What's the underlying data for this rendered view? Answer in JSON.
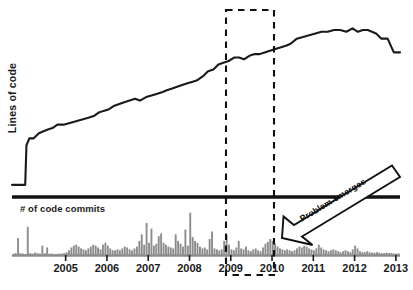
{
  "chart_data": {
    "type": "line",
    "title": "",
    "xlabel": "",
    "ylabel": "Lines of code",
    "grid": false,
    "legend": "none",
    "x_tick_labels": [
      "2005",
      "2006",
      "2007",
      "2008",
      "2009",
      "2010",
      "2011",
      "2012",
      "2013"
    ],
    "x_range": [
      "2004.2",
      "2013.6"
    ],
    "panels": [
      {
        "name": "lines-of-code",
        "type": "line",
        "ylabel": "Lines of code",
        "ylim": [
          0,
          100
        ],
        "series_name": "Lines of code",
        "line_color": "#1a1a1a",
        "x": [
          2004.2,
          2004.35,
          2004.45,
          2004.52,
          2004.55,
          2004.62,
          2004.72,
          2004.85,
          2004.95,
          2005.05,
          2005.18,
          2005.3,
          2005.45,
          2005.6,
          2005.75,
          2005.9,
          2006.05,
          2006.18,
          2006.3,
          2006.42,
          2006.55,
          2006.68,
          2006.8,
          2006.92,
          2007.05,
          2007.18,
          2007.3,
          2007.45,
          2007.58,
          2007.72,
          2007.85,
          2007.95,
          2008.08,
          2008.2,
          2008.32,
          2008.45,
          2008.58,
          2008.7,
          2008.82,
          2008.95,
          2009.08,
          2009.2,
          2009.32,
          2009.45,
          2009.58,
          2009.7,
          2009.82,
          2009.95,
          2010.08,
          2010.2,
          2010.32,
          2010.45,
          2010.58,
          2010.72,
          2010.85,
          2010.95,
          2011.1,
          2011.25,
          2011.4,
          2011.55,
          2011.7,
          2011.85,
          2012.0,
          2012.15,
          2012.3,
          2012.45,
          2012.58,
          2012.7,
          2012.82,
          2012.92,
          2013.02,
          2013.15,
          2013.3,
          2013.45,
          2013.6
        ],
        "y": [
          3,
          3,
          3,
          3,
          26,
          30,
          30,
          33,
          34,
          35,
          36,
          38,
          38,
          39,
          40,
          41,
          42,
          43,
          45,
          46,
          47,
          49,
          50,
          51,
          52,
          53,
          52,
          54,
          55,
          56,
          57,
          58,
          59,
          60,
          61,
          62,
          63,
          64,
          66,
          69,
          70,
          73,
          74,
          75,
          77,
          77,
          76,
          78,
          79,
          79,
          80,
          81,
          82,
          83,
          84,
          85,
          88,
          89,
          90,
          91,
          92,
          92,
          93,
          93,
          92,
          94,
          92,
          93,
          93,
          92,
          91,
          88,
          88,
          80,
          80
        ]
      },
      {
        "name": "code-commits",
        "type": "bar",
        "ylabel": "# of code commits",
        "ylim": [
          0,
          100
        ],
        "bar_color": "#8c8c8c",
        "baseline_color": "#8c8c8c",
        "values": [
          2,
          4,
          36,
          4,
          3,
          2,
          60,
          4,
          3,
          5,
          4,
          3,
          20,
          4,
          16,
          3,
          3,
          2,
          2,
          3,
          3,
          4,
          6,
          10,
          16,
          20,
          22,
          18,
          14,
          12,
          10,
          14,
          18,
          22,
          20,
          16,
          12,
          22,
          26,
          20,
          14,
          10,
          10,
          12,
          10,
          14,
          18,
          16,
          12,
          10,
          14,
          18,
          30,
          44,
          22,
          68,
          26,
          56,
          20,
          24,
          40,
          46,
          26,
          22,
          18,
          16,
          14,
          44,
          30,
          24,
          18,
          54,
          20,
          90,
          38,
          30,
          26,
          18,
          14,
          16,
          12,
          34,
          50,
          14,
          12,
          10,
          12,
          30,
          42,
          22,
          12,
          10,
          16,
          30,
          14,
          12,
          18,
          10,
          8,
          12,
          14,
          10,
          8,
          16,
          24,
          28,
          34,
          30,
          24,
          18,
          14,
          12,
          10,
          12,
          10,
          8,
          10,
          14,
          18,
          16,
          20,
          18,
          14,
          12,
          10,
          14,
          22,
          16,
          12,
          10,
          8,
          10,
          12,
          10,
          8,
          6,
          8,
          10,
          8,
          6,
          12,
          20,
          14,
          8,
          6,
          6,
          8,
          6,
          5,
          5,
          6,
          5,
          4,
          4,
          5,
          4,
          4,
          3,
          3,
          3
        ]
      }
    ],
    "annotations": [
      {
        "name": "problem-emerges-callout",
        "text": "Problem emerges",
        "type": "block-arrow",
        "direction": "down-left"
      },
      {
        "name": "highlight-box",
        "type": "dashed-rectangle",
        "spans": "2010"
      }
    ]
  },
  "labels": {
    "ylabel_lines_of_code": "Lines of code",
    "bar_panel_label": "# of code commits",
    "annotation": "Problem emerges"
  },
  "colors": {
    "line": "#1a1a1a",
    "bars": "#8c8c8c",
    "divider": "#111111",
    "dashed_box": "#111111",
    "background": "#ffffff",
    "text": "#1a1a1a"
  }
}
